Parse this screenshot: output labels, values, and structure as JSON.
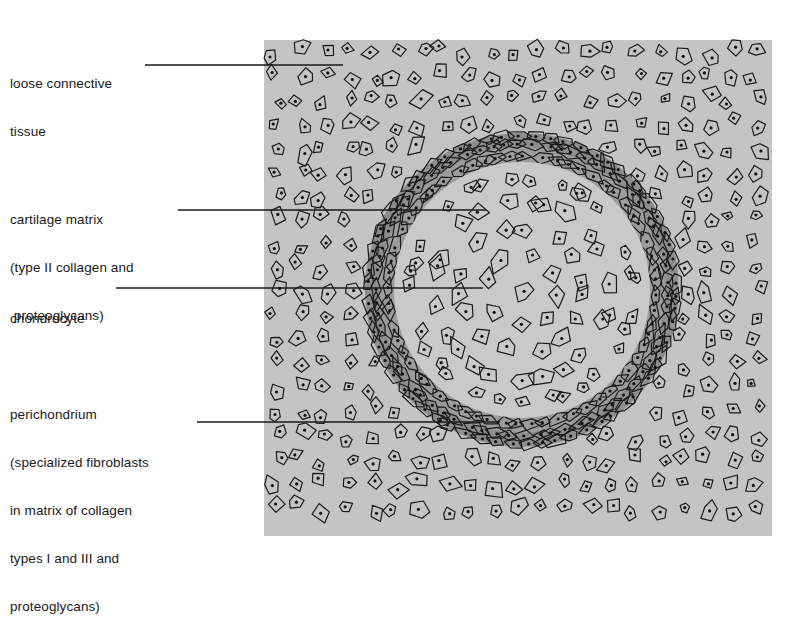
{
  "figure": {
    "type": "histology-diagram",
    "colors": {
      "background": "#ffffff",
      "connective_tissue": "#c4c4c4",
      "perichondrium_ring": "#8e8e8e",
      "cartilage_matrix": "#c9c9c9",
      "cell_outline": "#1a1a1a",
      "leader_line": "#1a1a1a"
    }
  },
  "labels": [
    {
      "id": "loose-connective-tissue",
      "lines": [
        "loose connective",
        "tissue"
      ]
    },
    {
      "id": "cartilage-matrix",
      "lines": [
        "cartilage matrix",
        "(type II collagen and",
        " proteoglycans)"
      ]
    },
    {
      "id": "chondrocyte",
      "lines": [
        "chondrocyte"
      ]
    },
    {
      "id": "perichondrium",
      "lines": [
        "perichondrium",
        "(specialized fibroblasts",
        "in matrix of collagen",
        "types I and III and",
        "proteoglycans)"
      ]
    }
  ],
  "label_text": {
    "loose_connective_tissue": "loose connective\ntissue",
    "cartilage_matrix": "cartilage matrix\n(type II collagen and —\n proteoglycans)",
    "chondrocyte": "chondrocyte",
    "perichondrium": "perichondrium\n(specialized fibroblasts\nin matrix of collagen\ntypes I and III and\nproteoglycans)"
  }
}
